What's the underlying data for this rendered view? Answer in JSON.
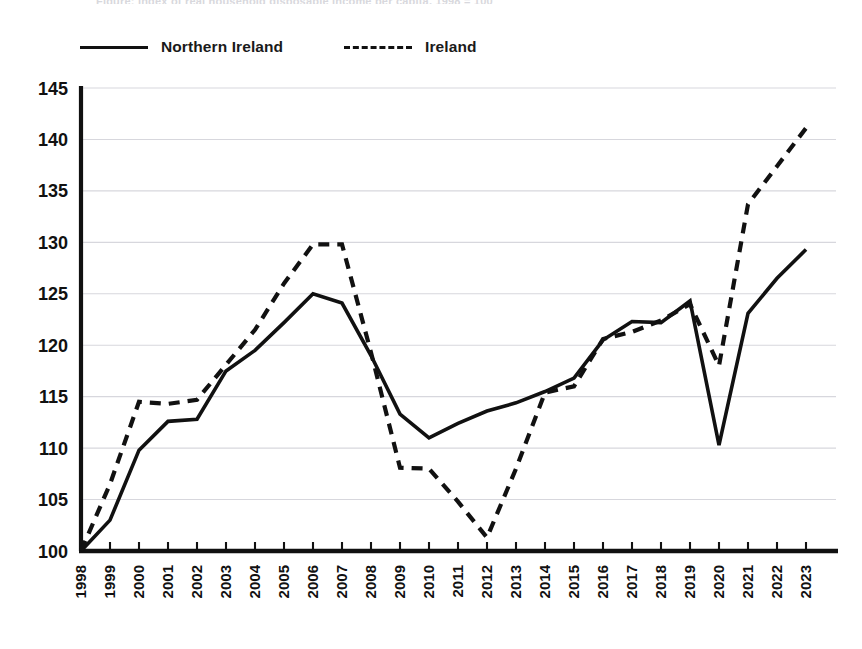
{
  "caption_sliver": "Figure: index of real household disposable income per capita, 1998 = 100",
  "legend": {
    "items": [
      {
        "label": "Northern Ireland",
        "style": "solid",
        "color": "#111111",
        "name": "legend-northern-ireland"
      },
      {
        "label": "Ireland",
        "style": "dashed",
        "color": "#111111",
        "name": "legend-ireland"
      }
    ]
  },
  "axes": {
    "y_ticks": [
      "100",
      "105",
      "110",
      "115",
      "120",
      "125",
      "130",
      "135",
      "140",
      "145"
    ],
    "x_ticks": [
      "1998",
      "1999",
      "2000",
      "2001",
      "2002",
      "2003",
      "2004",
      "2005",
      "2006",
      "2007",
      "2008",
      "2009",
      "2010",
      "2011",
      "2012",
      "2013",
      "2014",
      "2015",
      "2016",
      "2017",
      "2018",
      "2019",
      "2020",
      "2021",
      "2022",
      "2023"
    ]
  },
  "chart_data": {
    "type": "line",
    "title": "",
    "subtitle": "",
    "xlabel": "",
    "ylabel": "",
    "xlim": [
      1998,
      2023
    ],
    "ylim": [
      100,
      145
    ],
    "ytick_step": 5,
    "grid": "horizontal",
    "legend_position": "top-left",
    "x": [
      1998,
      1999,
      2000,
      2001,
      2002,
      2003,
      2004,
      2005,
      2006,
      2007,
      2008,
      2009,
      2010,
      2011,
      2012,
      2013,
      2014,
      2015,
      2016,
      2017,
      2018,
      2019,
      2020,
      2021,
      2022,
      2023
    ],
    "series": [
      {
        "name": "Northern Ireland",
        "style": "solid",
        "color": "#111111",
        "values": [
          100.0,
          103.0,
          109.8,
          112.6,
          112.8,
          117.5,
          119.5,
          122.2,
          125.0,
          124.1,
          119.0,
          113.3,
          111.0,
          112.4,
          113.6,
          114.4,
          115.5,
          116.8,
          120.5,
          122.3,
          122.2,
          124.3,
          110.3,
          123.1,
          126.5,
          129.3
        ]
      },
      {
        "name": "Ireland",
        "style": "dashed",
        "color": "#111111",
        "values": [
          100.0,
          106.5,
          114.5,
          114.3,
          114.7,
          118.1,
          121.5,
          126.0,
          129.8,
          129.8,
          119.3,
          108.1,
          108.0,
          104.8,
          101.3,
          108.0,
          115.4,
          116.0,
          120.6,
          121.3,
          122.4,
          124.0,
          118.0,
          133.7,
          137.4,
          141.1
        ]
      }
    ]
  }
}
